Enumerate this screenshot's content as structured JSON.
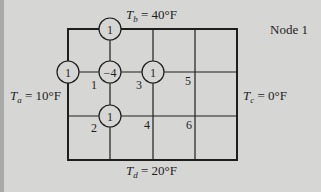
{
  "figure": {
    "title_label": "Node 1",
    "boundaries": {
      "top": {
        "symbol": "T",
        "sub": "b",
        "value": "= 40°F"
      },
      "left": {
        "symbol": "T",
        "sub": "a",
        "value": "= 10°F"
      },
      "right": {
        "symbol": "T",
        "sub": "c",
        "value": "= 0°F"
      },
      "bottom": {
        "symbol": "T",
        "sub": "d",
        "value": "= 20°F"
      }
    },
    "node_numbers": [
      "1",
      "2",
      "3",
      "4",
      "5",
      "6"
    ],
    "stencil": {
      "center": "−4",
      "top": "1",
      "left": "1",
      "right": "1",
      "bottom": "1"
    },
    "colors": {
      "background": "#d6d6d4",
      "line": "#1e1e1e"
    }
  }
}
